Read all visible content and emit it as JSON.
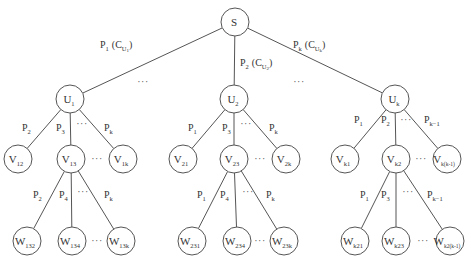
{
  "diagram": {
    "type": "tree",
    "root": {
      "id": "S",
      "label": "S",
      "sub": "",
      "x": 235,
      "y": 22,
      "r": 14
    },
    "nodes": [
      {
        "id": "U1",
        "label": "U",
        "sub": "1",
        "x": 70,
        "y": 99,
        "r": 14
      },
      {
        "id": "U2",
        "label": "U",
        "sub": "2",
        "x": 234,
        "y": 99,
        "r": 14
      },
      {
        "id": "Uk",
        "label": "U",
        "sub": "k",
        "x": 395,
        "y": 99,
        "r": 14
      },
      {
        "id": "V12",
        "label": "V",
        "sub": "12",
        "x": 18,
        "y": 159,
        "r": 14
      },
      {
        "id": "V13",
        "label": "V",
        "sub": "13",
        "x": 71,
        "y": 159,
        "r": 14
      },
      {
        "id": "V1k",
        "label": "V",
        "sub": "1k",
        "x": 123,
        "y": 159,
        "r": 14
      },
      {
        "id": "V21",
        "label": "V",
        "sub": "21",
        "x": 183,
        "y": 159,
        "r": 14
      },
      {
        "id": "V23",
        "label": "V",
        "sub": "23",
        "x": 234,
        "y": 159,
        "r": 14
      },
      {
        "id": "V2k",
        "label": "V",
        "sub": "2k",
        "x": 286,
        "y": 159,
        "r": 14
      },
      {
        "id": "Vk1",
        "label": "V",
        "sub": "k1",
        "x": 345,
        "y": 159,
        "r": 14
      },
      {
        "id": "Vk2",
        "label": "V",
        "sub": "k2",
        "x": 396,
        "y": 159,
        "r": 14
      },
      {
        "id": "Vkk-1",
        "label": "V",
        "sub": "k(k-1)",
        "x": 447,
        "y": 159,
        "r": 14
      },
      {
        "id": "W132",
        "label": "W",
        "sub": "132",
        "x": 27,
        "y": 241,
        "r": 14
      },
      {
        "id": "W134",
        "label": "W",
        "sub": "134",
        "x": 72,
        "y": 241,
        "r": 14
      },
      {
        "id": "W13k",
        "label": "W",
        "sub": "13k",
        "x": 121,
        "y": 241,
        "r": 14
      },
      {
        "id": "W231",
        "label": "W",
        "sub": "231",
        "x": 192,
        "y": 241,
        "r": 14
      },
      {
        "id": "W234",
        "label": "W",
        "sub": "234",
        "x": 237,
        "y": 241,
        "r": 14
      },
      {
        "id": "W23k",
        "label": "W",
        "sub": "23k",
        "x": 284,
        "y": 241,
        "r": 14
      },
      {
        "id": "Wk21",
        "label": "W",
        "sub": "k21",
        "x": 355,
        "y": 241,
        "r": 14
      },
      {
        "id": "Wk23",
        "label": "W",
        "sub": "k23",
        "x": 396,
        "y": 241,
        "r": 14
      },
      {
        "id": "Wk2k-1",
        "label": "W",
        "sub": "k2(k-1)",
        "x": 450,
        "y": 241,
        "r": 14
      }
    ],
    "edges": [
      {
        "from": "S",
        "to": "U1",
        "label": "P",
        "sub": "1",
        "extra": "(C",
        "extra_sub": "U",
        "extra_sub2": "1",
        "lx": 100,
        "ly": 48
      },
      {
        "from": "S",
        "to": "U2",
        "label": "P",
        "sub": "2",
        "extra": "(C",
        "extra_sub": "U",
        "extra_sub2": "2",
        "lx": 240,
        "ly": 66
      },
      {
        "from": "S",
        "to": "Uk",
        "label": "P",
        "sub": "k",
        "extra": "(C",
        "extra_sub": "U",
        "extra_sub2": "k",
        "lx": 293,
        "ly": 48
      },
      {
        "from": "U1",
        "to": "V12",
        "label": "P",
        "sub": "2",
        "lx": 22,
        "ly": 131
      },
      {
        "from": "U1",
        "to": "V13",
        "label": "P",
        "sub": "3",
        "lx": 56,
        "ly": 131
      },
      {
        "from": "U1",
        "to": "V1k",
        "label": "P",
        "sub": "k",
        "lx": 104,
        "ly": 131
      },
      {
        "from": "U2",
        "to": "V21",
        "label": "P",
        "sub": "1",
        "lx": 188,
        "ly": 131
      },
      {
        "from": "U2",
        "to": "V23",
        "label": "P",
        "sub": "3",
        "lx": 222,
        "ly": 131
      },
      {
        "from": "U2",
        "to": "V2k",
        "label": "P",
        "sub": "k",
        "lx": 269,
        "ly": 131
      },
      {
        "from": "Uk",
        "to": "Vk1",
        "label": "P",
        "sub": "1",
        "lx": 354,
        "ly": 123
      },
      {
        "from": "Uk",
        "to": "Vk2",
        "label": "P",
        "sub": "2",
        "lx": 381,
        "ly": 123
      },
      {
        "from": "Uk",
        "to": "Vkk-1",
        "label": "P",
        "sub": "k−1",
        "lx": 424,
        "ly": 123
      },
      {
        "from": "V13",
        "to": "W132",
        "label": "P",
        "sub": "2",
        "lx": 33,
        "ly": 198
      },
      {
        "from": "V13",
        "to": "W134",
        "label": "P",
        "sub": "4",
        "lx": 59,
        "ly": 198
      },
      {
        "from": "V13",
        "to": "W13k",
        "label": "P",
        "sub": "k",
        "lx": 104,
        "ly": 198
      },
      {
        "from": "V23",
        "to": "W231",
        "label": "P",
        "sub": "1",
        "lx": 197,
        "ly": 198
      },
      {
        "from": "V23",
        "to": "W234",
        "label": "P",
        "sub": "4",
        "lx": 220,
        "ly": 198
      },
      {
        "from": "V23",
        "to": "W23k",
        "label": "P",
        "sub": "k",
        "lx": 266,
        "ly": 198
      },
      {
        "from": "Vk2",
        "to": "Wk21",
        "label": "P",
        "sub": "1",
        "lx": 360,
        "ly": 198
      },
      {
        "from": "Vk2",
        "to": "Wk23",
        "label": "P",
        "sub": "3",
        "lx": 381,
        "ly": 198
      },
      {
        "from": "Vk2",
        "to": "Wk2k-1",
        "label": "P",
        "sub": "k−1",
        "lx": 427,
        "ly": 198
      }
    ],
    "ellipses": [
      {
        "text": "···",
        "x": 143,
        "y": 85
      },
      {
        "text": "···",
        "x": 299,
        "y": 85
      },
      {
        "text": "···",
        "x": 82,
        "y": 127
      },
      {
        "text": "···",
        "x": 246,
        "y": 127
      },
      {
        "text": "···",
        "x": 406,
        "y": 123
      },
      {
        "text": "···",
        "x": 97,
        "y": 162
      },
      {
        "text": "···",
        "x": 260,
        "y": 162
      },
      {
        "text": "···",
        "x": 421,
        "y": 162
      },
      {
        "text": "···",
        "x": 83,
        "y": 195
      },
      {
        "text": "···",
        "x": 248,
        "y": 195
      },
      {
        "text": "···",
        "x": 408,
        "y": 195
      },
      {
        "text": "···",
        "x": 97,
        "y": 244
      },
      {
        "text": "···",
        "x": 260,
        "y": 244
      },
      {
        "text": "···",
        "x": 423,
        "y": 244
      }
    ]
  }
}
